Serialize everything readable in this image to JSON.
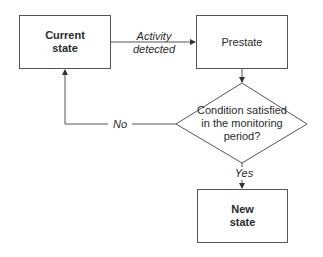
{
  "diagram": {
    "type": "flowchart",
    "nodes": {
      "current_state": {
        "label": "Current\nstate",
        "shape": "rectangle",
        "bold": true
      },
      "prestate": {
        "label": "Prestate",
        "shape": "rectangle",
        "bold": false
      },
      "condition": {
        "label": "Condition satisfied\nin the monitoring\nperiod?",
        "shape": "diamond"
      },
      "new_state": {
        "label": "New\nstate",
        "shape": "rectangle",
        "bold": true
      }
    },
    "edges": {
      "activity": {
        "from": "current_state",
        "to": "prestate",
        "label": "Activity\ndetected"
      },
      "to_condition": {
        "from": "prestate",
        "to": "condition",
        "label": ""
      },
      "no": {
        "from": "condition",
        "to": "current_state",
        "label": "No"
      },
      "yes": {
        "from": "condition",
        "to": "new_state",
        "label": "Yes"
      }
    },
    "colors": {
      "stroke": "#555555",
      "text": "#2a2a2a",
      "background": "#ffffff"
    }
  }
}
